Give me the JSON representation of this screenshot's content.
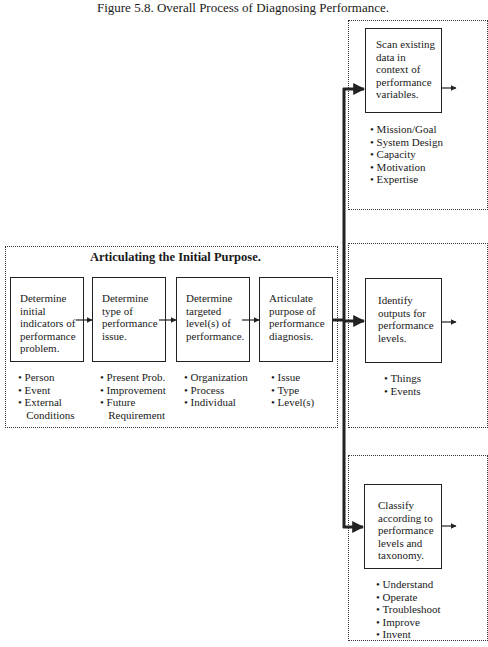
{
  "figure": {
    "title": "Figure 5.8. Overall Process of Diagnosing Performance."
  },
  "articulating_group": {
    "title": "Articulating the Initial Purpose.",
    "steps": [
      {
        "text": "Determine initial indicators of performance problem.",
        "lines": [
          "Determine",
          "initial",
          "indicators of",
          "performance",
          "problem."
        ],
        "bullets": [
          "• Person",
          "• Event",
          "• External",
          "   Conditions"
        ]
      },
      {
        "text": "Determine type of performance issue.",
        "lines": [
          "Determine",
          "type of",
          "performance",
          "issue."
        ],
        "bullets": [
          "• Present Prob.",
          "• Improvement",
          "• Future",
          "   Requirement"
        ]
      },
      {
        "text": "Determine targeted level(s) of performance.",
        "lines": [
          "Determine",
          "targeted",
          "level(s) of",
          "performance."
        ],
        "bullets": [
          "• Organization",
          "• Process",
          "• Individual"
        ]
      },
      {
        "text": "Articulate purpose of performance diagnosis.",
        "lines": [
          "Articulate",
          "purpose of",
          "performance",
          "diagnosis."
        ],
        "bullets": [
          "• Issue",
          "• Type",
          "• Level(s)"
        ]
      }
    ]
  },
  "branches": [
    {
      "lines": [
        "Scan existing",
        "data in",
        "context of",
        "performance",
        "variables."
      ],
      "bullets": [
        "• Mission/Goal",
        "• System Design",
        "• Capacity",
        "• Motivation",
        "• Expertise"
      ]
    },
    {
      "lines": [
        "Identify",
        "outputs for",
        "performance",
        "levels."
      ],
      "bullets": [
        "• Things",
        "• Events"
      ]
    },
    {
      "lines": [
        "Classify",
        "according to",
        "performance",
        "levels and",
        "taxonomy."
      ],
      "bullets": [
        "• Understand",
        "• Operate",
        "• Troubleshoot",
        "• Improve",
        "• Invent"
      ]
    }
  ],
  "colors": {
    "line": "#222222",
    "background": "#ffffff"
  }
}
